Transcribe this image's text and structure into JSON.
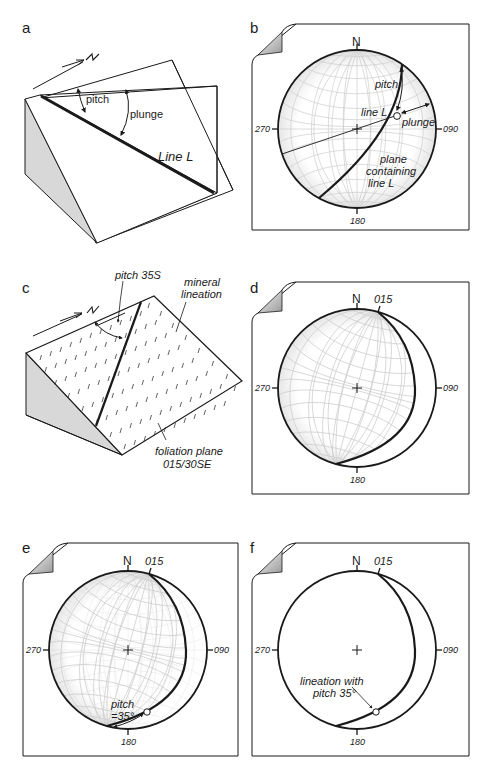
{
  "figure": {
    "panels": {
      "a": {
        "letter": "a",
        "labels": {
          "pitch": "pitch",
          "plunge": "plunge",
          "line": "Line L"
        },
        "north_arrow": "N"
      },
      "b": {
        "letter": "b",
        "compass": {
          "n": "N",
          "e": "090",
          "s": "180",
          "w": "270"
        },
        "labels": {
          "pitch": "pitch",
          "line": "line L",
          "plunge": "plunge",
          "plane_1": "plane",
          "plane_2": "containing",
          "plane_3": "line L"
        }
      },
      "c": {
        "letter": "c",
        "labels": {
          "pitch": "pitch 35S",
          "mineral_1": "mineral",
          "mineral_2": "lineation",
          "foliation_1": "foliation plane",
          "foliation_2": "015/30SE"
        }
      },
      "d": {
        "letter": "d",
        "compass": {
          "n": "N",
          "e": "090",
          "s": "180",
          "w": "270"
        },
        "strike": "015"
      },
      "e": {
        "letter": "e",
        "compass": {
          "n": "N",
          "e": "090",
          "s": "180",
          "w": "270"
        },
        "strike": "015",
        "labels": {
          "pitch_1": "pitch",
          "pitch_2": "=35°"
        }
      },
      "f": {
        "letter": "f",
        "compass": {
          "n": "N",
          "e": "090",
          "s": "180",
          "w": "270"
        },
        "strike": "015",
        "labels": {
          "lin_1": "lineation with",
          "lin_2": "pitch 35°"
        }
      }
    },
    "colors": {
      "ink": "#1a1a1a",
      "shade": "#d6d6d6",
      "grid": "#cfcfcf",
      "paper": "#ffffff"
    }
  }
}
